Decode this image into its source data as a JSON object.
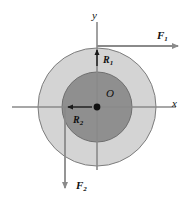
{
  "figure": {
    "background_color": "#ffffff",
    "axes": {
      "x_label": "x",
      "y_label": "y",
      "origin_label": "O",
      "line_color": "#8a8a8a",
      "origin_dot_color": "#101010"
    },
    "shapes": {
      "outer_disk": {
        "name": "outer-annulus",
        "fill": "#d4d4d4",
        "stroke": "#7d7d7d",
        "center_x": 97,
        "center_y": 107,
        "radius": 59
      },
      "inner_disk": {
        "name": "inner-disk",
        "fill": "#8f8f8f",
        "stroke": "#6e6e6e",
        "center_x": 97,
        "center_y": 107,
        "radius": 35
      }
    },
    "radii": [
      {
        "id": "R1",
        "label": "R",
        "subscript": "1",
        "direction": "up",
        "description": "outer radius measured upward from origin along y-axis"
      },
      {
        "id": "R2",
        "label": "R",
        "subscript": "2",
        "direction": "left",
        "description": "inner radius measured leftward from origin along x-axis"
      }
    ],
    "forces": [
      {
        "id": "F1",
        "label": "F",
        "subscript": "1",
        "direction": "right",
        "description": "horizontal force applied at top of outer disk pointing in +x",
        "color": "#8a8a8a"
      },
      {
        "id": "F2",
        "label": "F",
        "subscript": "2",
        "direction": "down",
        "description": "vertical force applied at left of inner disk pointing in -y",
        "color": "#8a8a8a"
      }
    ]
  }
}
